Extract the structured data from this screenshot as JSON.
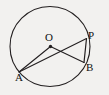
{
  "figure": {
    "type": "circle-geometry-diagram",
    "background_color": "#f2f1ef",
    "stroke_color": "#231f20",
    "label_color": "#111111",
    "canvas": {
      "width": 109,
      "height": 95
    },
    "circle": {
      "name": "main-circle",
      "center_x": 50,
      "center_y": 46.5,
      "radius": 40,
      "stroke_width": 1.1
    },
    "points": [
      {
        "id": "O",
        "label": "O",
        "x": 50.5,
        "y": 46.5,
        "marker": "dot",
        "role": "center"
      },
      {
        "id": "P",
        "label": "P",
        "x": 86.5,
        "y": 38.5,
        "marker": "none",
        "role": "on-circle"
      },
      {
        "id": "B",
        "label": "B",
        "x": 84.0,
        "y": 62.5,
        "marker": "none",
        "role": "on-circle"
      },
      {
        "id": "A",
        "label": "A",
        "x": 19.0,
        "y": 72.0,
        "marker": "none",
        "role": "on-circle"
      }
    ],
    "segments": [
      {
        "id": "AO",
        "from": "A",
        "to": "O",
        "x1": 19.0,
        "y1": 72.0,
        "x2": 50.5,
        "y2": 46.5
      },
      {
        "id": "AP",
        "from": "A",
        "to": "P",
        "x1": 19.0,
        "y1": 72.0,
        "x2": 86.5,
        "y2": 38.5
      },
      {
        "id": "OB",
        "from": "O",
        "to": "B",
        "x1": 50.5,
        "y1": 46.5,
        "x2": 84.0,
        "y2": 62.5
      },
      {
        "id": "PB",
        "from": "P",
        "to": "B",
        "x1": 86.5,
        "y1": 38.5,
        "x2": 84.0,
        "y2": 62.5
      }
    ],
    "labels": {
      "O": "O",
      "P": "P",
      "B": "B",
      "A": "A"
    }
  }
}
